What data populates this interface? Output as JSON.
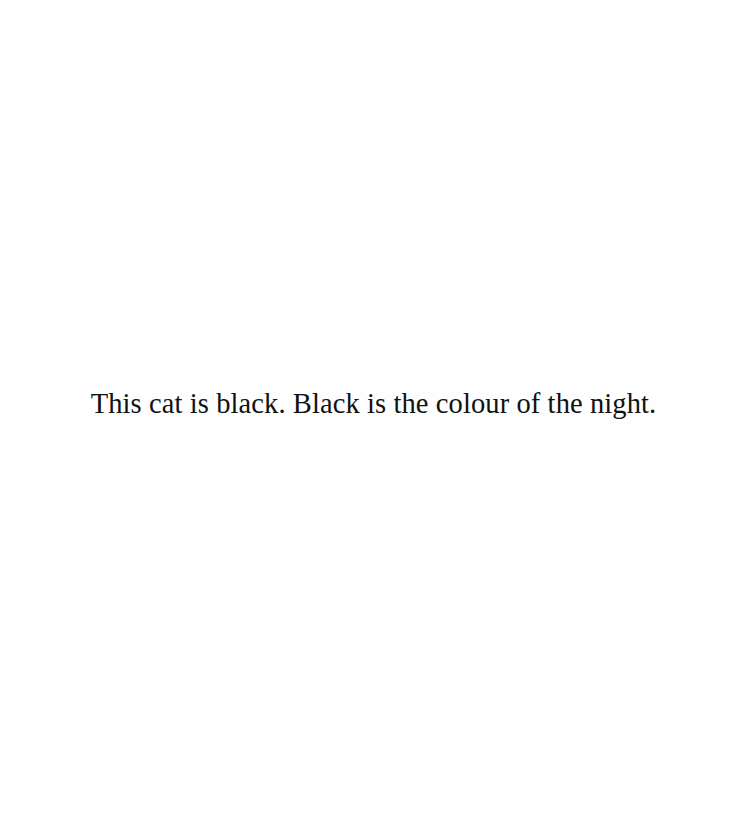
{
  "page": {
    "background": "#ffffff",
    "text_color": "#111111",
    "sentence": "This cat is black. Black is the colour of the night."
  }
}
